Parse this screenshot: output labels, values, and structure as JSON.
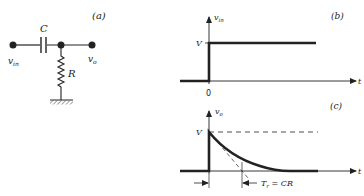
{
  "panels": {
    "a": {
      "label": "(a)",
      "capacitor_label": "C",
      "resistor_label": "R",
      "input_label": "v",
      "input_sub": "in",
      "output_label": "v",
      "output_sub": "o"
    },
    "b": {
      "label": "(b)",
      "y_axis_label": "v",
      "y_axis_sub": "in",
      "x_axis_label": "t",
      "level_label": "V",
      "origin_label": "0"
    },
    "c": {
      "label": "(c)",
      "y_axis_label": "v",
      "y_axis_sub": "o",
      "x_axis_label": "t",
      "level_label": "V",
      "time_constant_label": "T",
      "time_constant_sub": "r",
      "time_constant_eq": " = CR"
    }
  },
  "colors": {
    "ink": "#222222",
    "background": "#ffffff"
  }
}
